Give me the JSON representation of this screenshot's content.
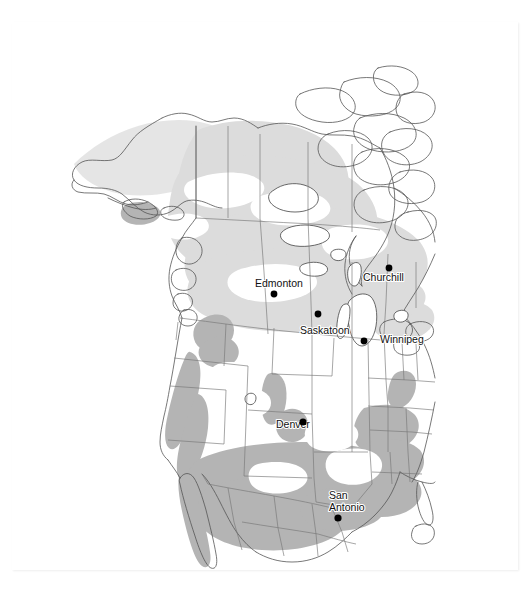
{
  "figure": {
    "type": "map",
    "region": "North America",
    "projection_note": "continental outline with administrative boundaries",
    "background_color": "#ffffff",
    "frame_color": "#f2f2f2"
  },
  "legend_colors": {
    "land_fill": "#ffffff",
    "range_light": "#dcdcdc",
    "range_medium": "#b4b4b4",
    "outline": "#555555",
    "boundary": "#777777",
    "city_dot": "#000000",
    "label_text": "#111111"
  },
  "cities": [
    {
      "name": "Edmonton",
      "label_x": 243,
      "label_y": 265,
      "label_anchor": "start",
      "dot_x": 262,
      "dot_y": 272,
      "dot_r": 3.4,
      "lines": [
        "Edmonton"
      ]
    },
    {
      "name": "Churchill",
      "label_x": 351,
      "label_y": 259,
      "label_anchor": "start",
      "dot_x": 377,
      "dot_y": 246,
      "dot_r": 3.4,
      "lines": [
        "Churchill"
      ]
    },
    {
      "name": "Saskatoon",
      "label_x": 288,
      "label_y": 312,
      "label_anchor": "start",
      "dot_x": 306,
      "dot_y": 292,
      "dot_r": 3.4,
      "lines": [
        "Saskatoon"
      ]
    },
    {
      "name": "Winnipeg",
      "label_x": 368,
      "label_y": 321,
      "label_anchor": "start",
      "dot_x": 352,
      "dot_y": 319,
      "dot_r": 3.4,
      "lines": [
        "Winnipeg"
      ]
    },
    {
      "name": "Denver",
      "label_x": 264,
      "label_y": 406,
      "label_anchor": "start",
      "dot_x": 291,
      "dot_y": 400,
      "dot_r": 3.6,
      "lines": [
        "Denver"
      ]
    },
    {
      "name": "San Antonio",
      "label_x": 317,
      "label_y": 477,
      "label_anchor": "start",
      "dot_x": 326,
      "dot_y": 496,
      "dot_r": 3.6,
      "lines": [
        "San",
        "Antonio"
      ]
    }
  ]
}
